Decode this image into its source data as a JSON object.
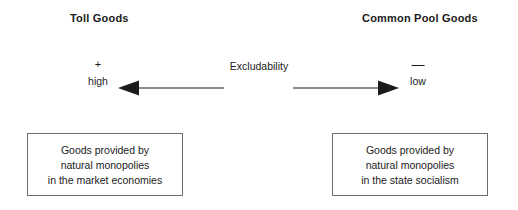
{
  "figure": {
    "headings": {
      "left": "Toll Goods",
      "right": "Common Pool Goods"
    },
    "axis": {
      "label": "Excludability",
      "left_pole": {
        "sign": "+",
        "word": "high"
      },
      "right_pole": {
        "sign": "—",
        "word": "low"
      }
    },
    "boxes": {
      "left": {
        "line1": "Goods provided by",
        "line2": "natural monopolies",
        "line3": "in the market economies"
      },
      "right": {
        "line1": "Goods provided by",
        "line2": "natural monopolies",
        "line3": "in the state socialism"
      }
    },
    "colors": {
      "background": "#ffffff",
      "text": "#1b1b1b",
      "stroke": "#1b1b1b",
      "box_border": "#6d6d6d"
    }
  }
}
